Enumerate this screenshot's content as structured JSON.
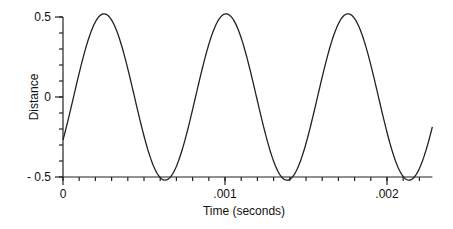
{
  "chart_data": {
    "type": "line",
    "title": "",
    "xlabel": "Time (seconds)",
    "ylabel": "Distance",
    "xlim": [
      0,
      0.00228
    ],
    "ylim": [
      -0.5,
      0.5
    ],
    "grid": false,
    "legend": null,
    "x_ticks": [
      {
        "value": 0,
        "label": "0"
      },
      {
        "value": 0.001,
        "label": ".001"
      },
      {
        "value": 0.002,
        "label": ".002"
      }
    ],
    "x_minor_tick_step": 0.0001,
    "y_ticks": [
      {
        "value": 0.5,
        "label": "0.5"
      },
      {
        "value": 0,
        "label": "0"
      },
      {
        "value": -0.5,
        "label": "- 0.5"
      }
    ],
    "y_minor_tick_step": 0.1,
    "series": [
      {
        "name": "Distance",
        "function": "sinusoid",
        "amplitude": 0.52,
        "period": 0.000753,
        "phase_shift": 6.5e-05,
        "x": [
          0,
          6.5e-05,
          0.000253,
          0.000441,
          0.00063,
          0.000818,
          0.001006,
          0.001194,
          0.001383,
          0.001571,
          0.001759,
          0.001947,
          0.002136,
          0.00228
        ],
        "values": [
          -0.27,
          0.0,
          0.52,
          0.0,
          -0.52,
          0.0,
          0.52,
          0.0,
          -0.52,
          0.0,
          0.52,
          0.0,
          -0.52,
          -0.17
        ]
      }
    ]
  }
}
